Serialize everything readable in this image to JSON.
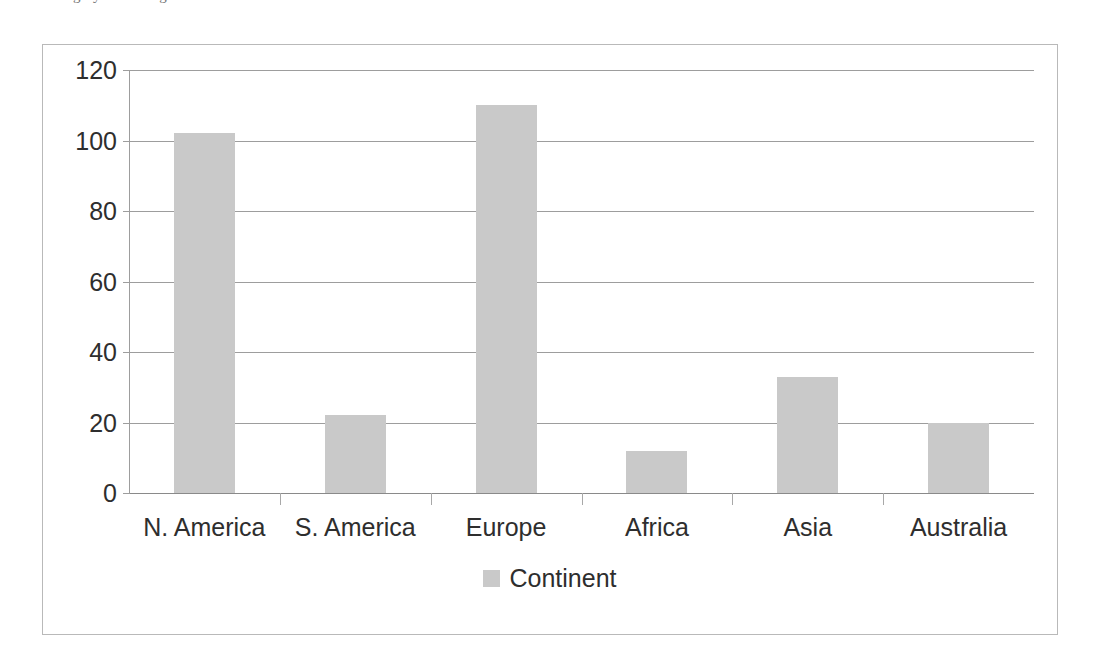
{
  "caption_cut_off": "sales category for the regions",
  "chart_data": {
    "type": "bar",
    "title": "",
    "xlabel": "",
    "ylabel": "",
    "categories": [
      "N. America",
      "S. America",
      "Europe",
      "Africa",
      "Asia",
      "Australia"
    ],
    "values": [
      102,
      22,
      110,
      12,
      33,
      20
    ],
    "series": [
      {
        "name": "Continent",
        "values": [
          102,
          22,
          110,
          12,
          33,
          20
        ]
      }
    ],
    "ylim": [
      0,
      120
    ],
    "yticks": [
      0,
      20,
      40,
      60,
      80,
      100,
      120
    ],
    "ytick_labels": [
      "0",
      "20",
      "40",
      "60",
      "80",
      "100",
      "120"
    ],
    "grid": true,
    "legend": {
      "position": "bottom",
      "entries": [
        {
          "label": "Continent",
          "color": "#c9c9c9"
        }
      ]
    },
    "colors": {
      "bar": "#c9c9c9",
      "grid": "#9d9d9d",
      "axis": "#8a8a8a",
      "frame": "#b9b9b9",
      "text": "#2e2e2e"
    }
  }
}
